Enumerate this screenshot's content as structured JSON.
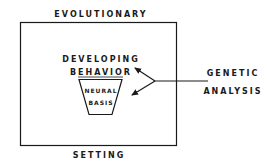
{
  "diagram": {
    "outer_top_label": "EVOLUTIONARY",
    "outer_bottom_label": "SETTING",
    "inner_line1": "DEVELOPING",
    "inner_line2": "BEHAVIOR",
    "trapezoid_line1": "NEURAL",
    "trapezoid_line2": "BASIS",
    "right_line1": "GENETIC",
    "right_line2": "ANALYSIS",
    "colors": {
      "stroke": "#1a1a1a",
      "background": "#ffffff"
    }
  }
}
